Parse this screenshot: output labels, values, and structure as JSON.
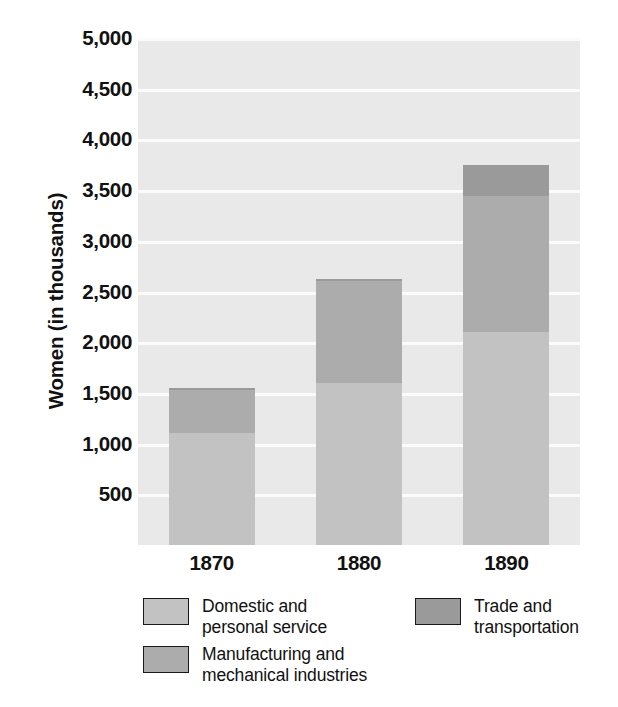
{
  "chart_data": {
    "type": "bar",
    "subtype": "stacked-bar",
    "title": "",
    "xlabel": "",
    "ylabel": "Women (in thousands)",
    "categories": [
      "1870",
      "1880",
      "1890"
    ],
    "series": [
      {
        "name": "Domestic and\npersonal service",
        "color": "#c2c2c2",
        "values": [
          1100,
          1600,
          2100
        ]
      },
      {
        "name": "Manufacturing and\nmechanical industries",
        "color": "#acacac",
        "values": [
          430,
          1000,
          1340
        ]
      },
      {
        "name": "Trade and\ntransportation",
        "color": "#9a9a9a",
        "values": [
          20,
          20,
          310
        ]
      }
    ],
    "totals": [
      1550,
      2620,
      3750
    ],
    "ylim": [
      0,
      5000
    ],
    "ytick_values": [
      500,
      1000,
      1500,
      2000,
      2500,
      3000,
      3500,
      4000,
      4500,
      5000
    ],
    "ytick_labels": [
      "500",
      "1,000",
      "1,500",
      "2,000",
      "2,500",
      "3,000",
      "3,500",
      "4,000",
      "4,500",
      "5,000"
    ],
    "grid": true,
    "grid_axis": "y",
    "grid_color": "#fbfbfb",
    "plot_background": "#e9e9e9",
    "legend_position": "bottom"
  },
  "axis": {
    "y_title": "Women (in thousands)",
    "y_ticks": [
      {
        "label": "5,000",
        "value": 5000
      },
      {
        "label": "4,500",
        "value": 4500
      },
      {
        "label": "4,000",
        "value": 4000
      },
      {
        "label": "3,500",
        "value": 3500
      },
      {
        "label": "3,000",
        "value": 3000
      },
      {
        "label": "2,500",
        "value": 2500
      },
      {
        "label": "2,000",
        "value": 2000
      },
      {
        "label": "1,500",
        "value": 1500
      },
      {
        "label": "1,000",
        "value": 1000
      },
      {
        "label": "500",
        "value": 500
      }
    ],
    "x_ticks": [
      {
        "label": "1870"
      },
      {
        "label": "1880"
      },
      {
        "label": "1890"
      }
    ]
  },
  "legend": {
    "items": [
      {
        "label": "Domestic and\npersonal service",
        "color": "#c2c2c2"
      },
      {
        "label": "Trade and\ntransportation",
        "color": "#9a9a9a"
      },
      {
        "label": "Manufacturing and\nmechanical industries",
        "color": "#acacac"
      }
    ]
  }
}
